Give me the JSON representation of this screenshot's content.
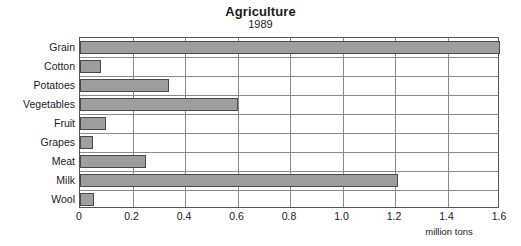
{
  "chart_data": {
    "type": "bar",
    "orientation": "horizontal",
    "title": "Agriculture",
    "subtitle": "1989",
    "xlabel": "million tons",
    "ylabel": "",
    "xlim": [
      0,
      1.6
    ],
    "xticks": [
      "0",
      "0.2",
      "0.4",
      "0.6",
      "0.8",
      "1.0",
      "1.2",
      "1.4",
      "1.6"
    ],
    "xtick_values": [
      0,
      0.2,
      0.4,
      0.6,
      0.8,
      1.0,
      1.2,
      1.4,
      1.6
    ],
    "grid": true,
    "legend": "none",
    "categories": [
      "Grain",
      "Cotton",
      "Potatoes",
      "Vegetables",
      "Fruit",
      "Grapes",
      "Meat",
      "Milk",
      "Wool"
    ],
    "values": [
      1.6,
      0.08,
      0.34,
      0.6,
      0.1,
      0.05,
      0.25,
      1.21,
      0.055
    ],
    "bars": [
      {
        "label": "Grain",
        "value": 1.6
      },
      {
        "label": "Cotton",
        "value": 0.08
      },
      {
        "label": "Potatoes",
        "value": 0.34
      },
      {
        "label": "Vegetables",
        "value": 0.6
      },
      {
        "label": "Fruit",
        "value": 0.1
      },
      {
        "label": "Grapes",
        "value": 0.05
      },
      {
        "label": "Meat",
        "value": 0.25
      },
      {
        "label": "Milk",
        "value": 1.21
      },
      {
        "label": "Wool",
        "value": 0.055
      }
    ]
  },
  "colors": {
    "bar_fill": "#9e9e9e",
    "bar_border": "#4a4a4a",
    "gridline": "#8a8a8a",
    "frame": "#555555",
    "background": "#ffffff",
    "text": "#1a1a1a"
  }
}
